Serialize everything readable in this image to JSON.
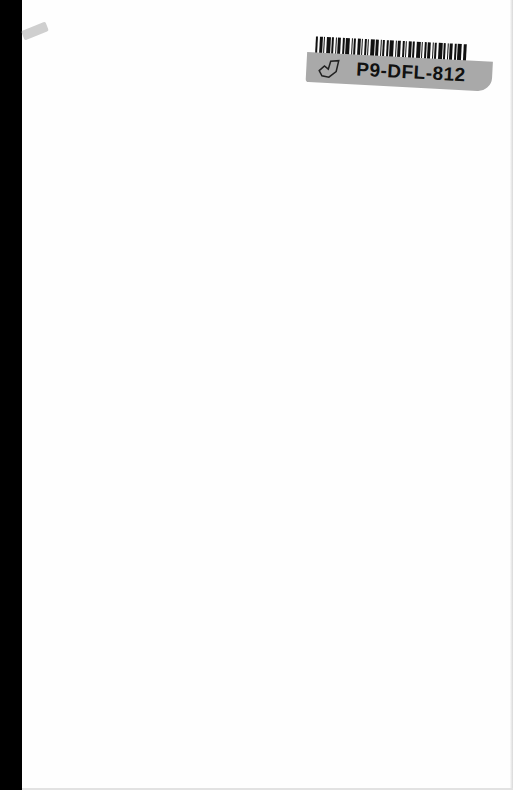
{
  "document": {
    "type": "scanned-book-page",
    "background_color": "#fefefe",
    "binding_edge_color": "#000000"
  },
  "sticker": {
    "barcode_icon": "barcode-icon",
    "label_icon": "book-outline-icon",
    "label_text": "P9-DFL-812",
    "band_color": "#a9a9a9"
  }
}
